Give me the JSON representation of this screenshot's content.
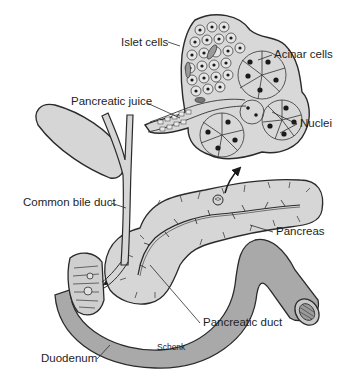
{
  "diagram": {
    "colors": {
      "tissue_fill": "#d6d6d6",
      "duodenum_fill": "#a9a9a9",
      "outline": "#2a2a2a",
      "nucleus": "#1a1a1a",
      "background": "#ffffff"
    },
    "labels": {
      "islet_cells": "Islet cells",
      "acinar_cells": "Acinar cells",
      "pancreatic_juice": "Pancreatic juice",
      "nuclei": "Nuclei",
      "common_bile_duct": "Common bile duct",
      "pancreas": "Pancreas",
      "pancreatic_duct": "Pancreatic duct",
      "duodenum": "Duodenum",
      "credit": "Schenk"
    }
  }
}
